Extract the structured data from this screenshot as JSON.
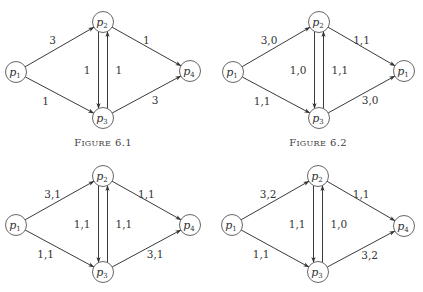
{
  "figures": [
    {
      "id": "fig-6-1",
      "caption": {
        "first": "F",
        "rest": "IGURE",
        "number": "6.1"
      },
      "offset": [
        0,
        0
      ],
      "nodes": [
        {
          "id": "p1",
          "base": "p",
          "sub": "1",
          "x": 16,
          "y": 72
        },
        {
          "id": "p2",
          "base": "p",
          "sub": "2",
          "x": 103,
          "y": 22
        },
        {
          "id": "p3",
          "base": "p",
          "sub": "3",
          "x": 103,
          "y": 118
        },
        {
          "id": "p4",
          "base": "p",
          "sub": "4",
          "x": 190,
          "y": 71
        }
      ],
      "edges": [
        {
          "from": "p1",
          "to": "p2",
          "label": "3"
        },
        {
          "from": "p1",
          "to": "p3",
          "label": "1"
        },
        {
          "from": "p2",
          "to": "p3",
          "label": "1"
        },
        {
          "from": "p3",
          "to": "p2",
          "label": "1"
        },
        {
          "from": "p2",
          "to": "p4",
          "label": "1"
        },
        {
          "from": "p3",
          "to": "p4",
          "label": "3"
        }
      ]
    },
    {
      "id": "fig-6-2",
      "caption": {
        "first": "F",
        "rest": "IGURE",
        "number": "6.2"
      },
      "offset": [
        0,
        0
      ],
      "nodes": [
        {
          "id": "p1",
          "base": "p",
          "sub": "1",
          "x": 233,
          "y": 72
        },
        {
          "id": "p2",
          "base": "p",
          "sub": "2",
          "x": 319,
          "y": 22
        },
        {
          "id": "p3",
          "base": "p",
          "sub": "3",
          "x": 319,
          "y": 118
        },
        {
          "id": "p4",
          "base": "p",
          "sub": "1",
          "x": 404,
          "y": 71
        }
      ],
      "edges": [
        {
          "from": "p1",
          "to": "p2",
          "label": "3,0"
        },
        {
          "from": "p1",
          "to": "p3",
          "label": "1,1"
        },
        {
          "from": "p2",
          "to": "p3",
          "label": "1,0"
        },
        {
          "from": "p3",
          "to": "p2",
          "label": "1,1"
        },
        {
          "from": "p2",
          "to": "p4",
          "label": "1,1"
        },
        {
          "from": "p3",
          "to": "p4",
          "label": "3,0"
        }
      ]
    },
    {
      "id": "fig-6-3",
      "caption": null,
      "offset": [
        0,
        0
      ],
      "nodes": [
        {
          "id": "p1",
          "base": "p",
          "sub": "1",
          "x": 16,
          "y": 225
        },
        {
          "id": "p2",
          "base": "p",
          "sub": "2",
          "x": 103,
          "y": 176
        },
        {
          "id": "p3",
          "base": "p",
          "sub": "3",
          "x": 103,
          "y": 272
        },
        {
          "id": "p4",
          "base": "p",
          "sub": "4",
          "x": 190,
          "y": 225
        }
      ],
      "edges": [
        {
          "from": "p1",
          "to": "p2",
          "label": "3,1"
        },
        {
          "from": "p1",
          "to": "p3",
          "label": "1,1"
        },
        {
          "from": "p2",
          "to": "p3",
          "label": "1,1"
        },
        {
          "from": "p3",
          "to": "p2",
          "label": "1,1"
        },
        {
          "from": "p2",
          "to": "p4",
          "label": "1,1"
        },
        {
          "from": "p3",
          "to": "p4",
          "label": "3,1"
        }
      ]
    },
    {
      "id": "fig-6-4",
      "caption": null,
      "offset": [
        0,
        0
      ],
      "nodes": [
        {
          "id": "p1",
          "base": "p",
          "sub": "1",
          "x": 232,
          "y": 225
        },
        {
          "id": "p2",
          "base": "p",
          "sub": "2",
          "x": 318,
          "y": 176
        },
        {
          "id": "p3",
          "base": "p",
          "sub": "3",
          "x": 318,
          "y": 272
        },
        {
          "id": "p4",
          "base": "p",
          "sub": "4",
          "x": 404,
          "y": 226
        }
      ],
      "edges": [
        {
          "from": "p1",
          "to": "p2",
          "label": "3,2"
        },
        {
          "from": "p1",
          "to": "p3",
          "label": "1,1"
        },
        {
          "from": "p2",
          "to": "p3",
          "label": "1,1"
        },
        {
          "from": "p3",
          "to": "p2",
          "label": "1,0"
        },
        {
          "from": "p2",
          "to": "p4",
          "label": "1,1"
        },
        {
          "from": "p3",
          "to": "p4",
          "label": "3,2"
        }
      ]
    }
  ],
  "captions_layout": [
    {
      "figure": "fig-6-1",
      "x": 103,
      "y": 146
    },
    {
      "figure": "fig-6-2",
      "x": 318,
      "y": 146
    }
  ],
  "colors": {
    "stroke": "#3a3a3a",
    "node_stroke": "#555555",
    "text": "#333333",
    "background": "#ffffff"
  }
}
